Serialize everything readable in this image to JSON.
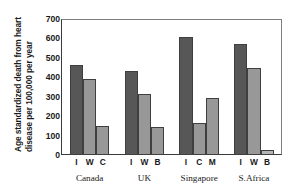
{
  "chart_data": {
    "type": "bar",
    "title": "",
    "xlabel": "",
    "ylabel": "Age standardized death from heart disease per 100,000 per year",
    "ylabel_line1": "Age standardized death from heart",
    "ylabel_line2": "disease per 100,000 per year",
    "ylim": [
      0,
      700
    ],
    "ytick_values": [
      700,
      600,
      500,
      400,
      300,
      200,
      100,
      0
    ],
    "ytick_labels": [
      "700",
      "600",
      "500",
      "400",
      "300",
      "200",
      "100",
      "0"
    ],
    "grid": false,
    "legend": "none",
    "groups": [
      {
        "name": "Canada",
        "bars": [
          {
            "label": "I",
            "value": 465,
            "color": "#575757"
          },
          {
            "label": "W",
            "value": 390,
            "color": "#989898"
          },
          {
            "label": "C",
            "value": 150,
            "color": "#989898"
          }
        ]
      },
      {
        "name": "UK",
        "bars": [
          {
            "label": "I",
            "value": 430,
            "color": "#575757"
          },
          {
            "label": "W",
            "value": 315,
            "color": "#989898"
          },
          {
            "label": "B",
            "value": 145,
            "color": "#989898"
          }
        ]
      },
      {
        "name": "Singapore",
        "bars": [
          {
            "label": "I",
            "value": 610,
            "color": "#575757"
          },
          {
            "label": "C",
            "value": 165,
            "color": "#989898"
          },
          {
            "label": "M",
            "value": 295,
            "color": "#989898"
          }
        ]
      },
      {
        "name": "S.Africa",
        "bars": [
          {
            "label": "I",
            "value": 570,
            "color": "#575757"
          },
          {
            "label": "W",
            "value": 450,
            "color": "#989898"
          },
          {
            "label": "B",
            "value": 25,
            "color": "#b4b4b4"
          }
        ]
      }
    ],
    "colors": {
      "bar_dark": "#575757",
      "bar_light": "#989898",
      "bar_pale": "#b4b4b4",
      "axis": "#3b3b3b",
      "background": "#ffffff",
      "text": "#1a1a1a"
    }
  }
}
